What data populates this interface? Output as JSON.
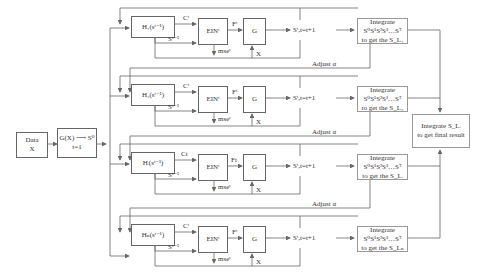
{
  "input": {
    "line1": "Data",
    "line2": "X"
  },
  "init": {
    "line1": "G(X) ⟶ S⁰",
    "line2": "t=1"
  },
  "branches": [
    {
      "h_label": "H₁(sᵗ⁻¹)",
      "c_label": "Cᵗ",
      "s_label": "Sᵗ⁻¹",
      "ein_label": "EINᵗ",
      "f_label": "Fᵗ",
      "mse_label": "mseᵗ",
      "g_label": "G",
      "x_label": "X",
      "st_label": "Sᵗ,t=t+1",
      "integrate_line1": "Integrate S⁰S¹S²S³…Sᵀ",
      "integrate_line2": "to get the S_L₁",
      "adjust_label": "Adjust α"
    },
    {
      "h_label": "H₂(sᵗ⁻¹)",
      "c_label": "Cᵗ",
      "s_label": "Sᵗ⁻¹",
      "ein_label": "EINᵗ",
      "f_label": "Fᵗ",
      "mse_label": "mseᵗ",
      "g_label": "G",
      "x_label": "X",
      "st_label": "Sᵗ,t=t+1",
      "integrate_line1": "Integrate S⁰S¹S²S³…Sᵀ",
      "integrate_line2": "to get the S_L₂",
      "adjust_label": "Adjust α"
    },
    {
      "h_label": "Hᵢ(sᵗ⁻¹)",
      "c_label": "Ct",
      "s_label": "Sᵗ⁻¹",
      "ein_label": "EINᵗ",
      "f_label": "Ft",
      "mse_label": "mseᵗ",
      "g_label": "G",
      "x_label": "X",
      "st_label": "Sᵗ,t=t+1",
      "integrate_line1": "Integrate S⁰S¹S²S³…Sᵀ",
      "integrate_line2": "to get the S_Lᵢ",
      "adjust_label": "Adjust α"
    },
    {
      "h_label": "Hₙ(sᵗ⁻¹)",
      "c_label": "Cᵗ",
      "s_label": "Sᵗ⁻¹",
      "ein_label": "EINᵗ",
      "f_label": "Fᵗ",
      "mse_label": "mseᵗ",
      "g_label": "G",
      "x_label": "X",
      "st_label": "Sᵗ,t=t+1",
      "integrate_line1": "Integrate S⁰S¹S²S³…Sᵀ",
      "integrate_line2": "to get the S_Lₙ",
      "adjust_label": null
    }
  ],
  "final": {
    "line1": "Integrate  S_Lᵢ",
    "line2": "to get final result"
  },
  "colors": {
    "stroke": "#666666",
    "light_stroke": "#999999",
    "text": "#333333"
  }
}
